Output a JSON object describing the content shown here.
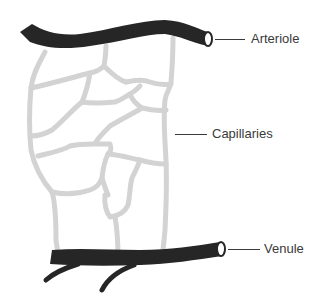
{
  "figure": {
    "labels": {
      "arteriole": "Arteriole",
      "capillaries": "Capillaries",
      "venule": "Venule"
    },
    "colors": {
      "vessel": "#262626",
      "capillary": "#d3d3d3",
      "label_text": "#3a3a3a",
      "background": "#ffffff"
    }
  }
}
